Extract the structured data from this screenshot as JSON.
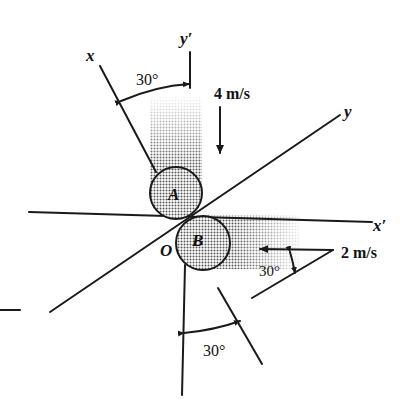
{
  "diagram": {
    "type": "collision-vector-diagram",
    "labels": {
      "axis_x": "x",
      "axis_y_prime": "y′",
      "axis_y": "y",
      "axis_x_prime": "x′",
      "origin": "O",
      "ball_a": "A",
      "ball_b": "B",
      "velocity_a": "4 m/s",
      "velocity_b": "2 m/s",
      "angle_top": "30°",
      "angle_bottom": "30°",
      "angle_velocity_b": "30°"
    },
    "colors": {
      "line": "#1a1a1a",
      "shading": "#8a8a8a",
      "background": "#ffffff"
    }
  }
}
